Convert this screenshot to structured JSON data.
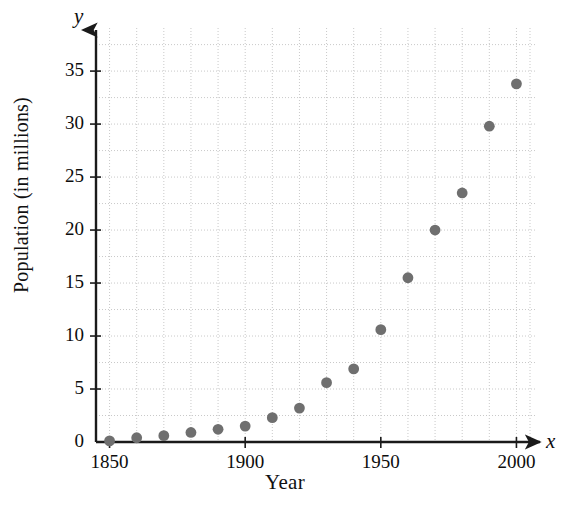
{
  "chart_data": {
    "type": "scatter",
    "title": "",
    "xlabel": "Year",
    "ylabel": "Population (in millions)",
    "x_axis_letter": "x",
    "y_axis_letter": "y",
    "xlim": [
      1845,
      2008
    ],
    "ylim": [
      0,
      38.5
    ],
    "x_ticks": [
      1850,
      1900,
      1950,
      2000
    ],
    "x_tick_labels": [
      "1850",
      "1900",
      "1950",
      "2000"
    ],
    "y_ticks": [
      0,
      5,
      10,
      15,
      20,
      25,
      30,
      35
    ],
    "y_tick_labels": [
      "0",
      "5",
      "10",
      "15",
      "20",
      "25",
      "30",
      "35"
    ],
    "grid": true,
    "grid_style": "dotted",
    "x_gridline_step": 10,
    "y_gridline_step": 2.5,
    "legend": "none",
    "marker": "filled-circle",
    "marker_color": "#6f6f6f",
    "grid_color": "#c9c9c9",
    "axis_color": "#1a1a1a",
    "x": [
      1850,
      1860,
      1870,
      1880,
      1890,
      1900,
      1910,
      1920,
      1930,
      1940,
      1950,
      1960,
      1970,
      1980,
      1990,
      2000
    ],
    "values": [
      0.1,
      0.4,
      0.6,
      0.9,
      1.2,
      1.5,
      2.3,
      3.2,
      5.6,
      6.9,
      10.6,
      15.5,
      20.0,
      23.5,
      29.8,
      33.8
    ],
    "points": [
      {
        "x": 1850,
        "y": 0.1
      },
      {
        "x": 1860,
        "y": 0.4
      },
      {
        "x": 1870,
        "y": 0.6
      },
      {
        "x": 1880,
        "y": 0.9
      },
      {
        "x": 1890,
        "y": 1.2
      },
      {
        "x": 1900,
        "y": 1.5
      },
      {
        "x": 1910,
        "y": 2.3
      },
      {
        "x": 1920,
        "y": 3.2
      },
      {
        "x": 1930,
        "y": 5.6
      },
      {
        "x": 1940,
        "y": 6.9
      },
      {
        "x": 1950,
        "y": 10.6
      },
      {
        "x": 1960,
        "y": 15.5
      },
      {
        "x": 1970,
        "y": 20.0
      },
      {
        "x": 1980,
        "y": 23.5
      },
      {
        "x": 1990,
        "y": 29.8
      },
      {
        "x": 2000,
        "y": 33.8
      }
    ]
  }
}
